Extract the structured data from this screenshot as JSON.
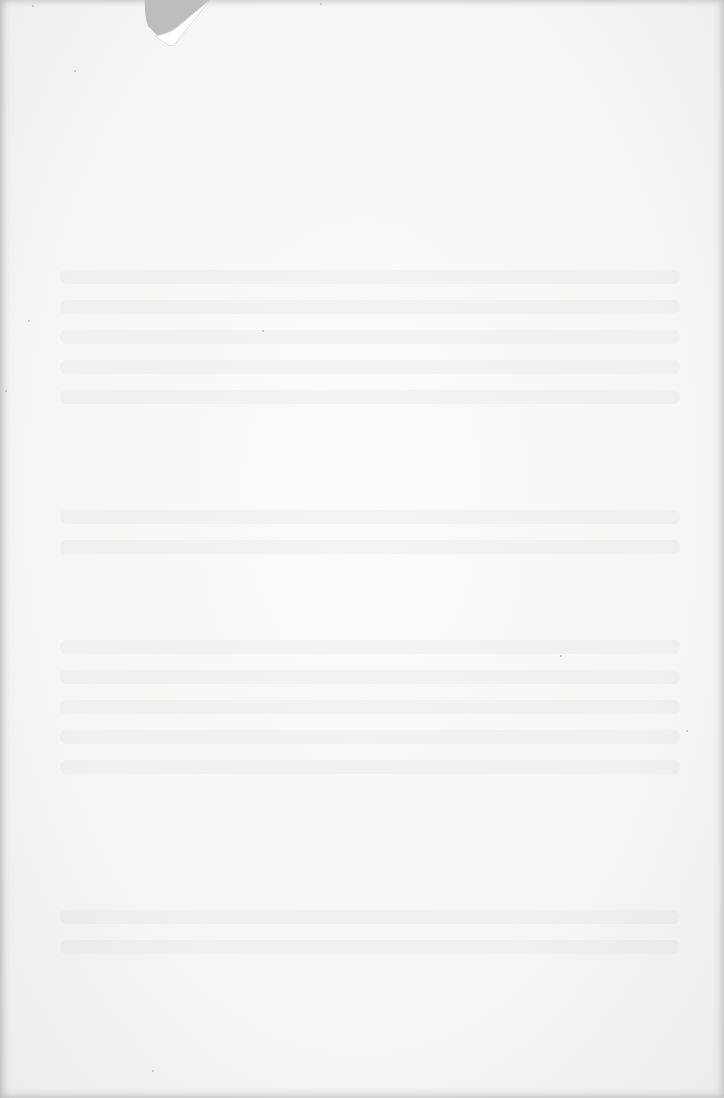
{
  "document": {
    "type": "blank scanned page",
    "text": "",
    "paper_color": "#f7f7f6",
    "background_color": "#c9c9c9",
    "features": [
      "torn-corner",
      "reverse-side-bleed-through"
    ]
  }
}
